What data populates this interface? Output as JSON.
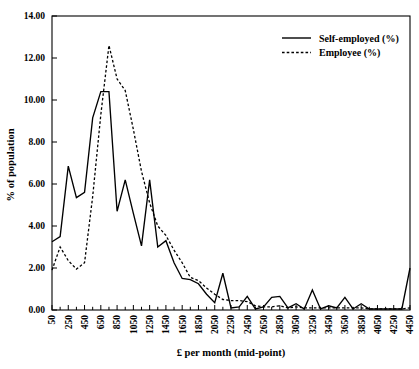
{
  "chart_data": {
    "type": "line",
    "title": "",
    "xlabel": "£ per month (mid-point)",
    "ylabel": "% of population",
    "xlim": [
      50,
      4450
    ],
    "ylim": [
      0.0,
      14.0
    ],
    "yticks": [
      "0.00",
      "2.00",
      "4.00",
      "6.00",
      "8.00",
      "10.00",
      "12.00",
      "14.00"
    ],
    "ytick_values": [
      0,
      2,
      4,
      6,
      8,
      10,
      12,
      14
    ],
    "grid": false,
    "legend_position": "top-right",
    "categories": [
      "50",
      "150",
      "250",
      "350",
      "450",
      "550",
      "650",
      "750",
      "850",
      "950",
      "1050",
      "1150",
      "1250",
      "1350",
      "1450",
      "1550",
      "1650",
      "1750",
      "1850",
      "1950",
      "2050",
      "2150",
      "2250",
      "2350",
      "2450",
      "2550",
      "2650",
      "2750",
      "2850",
      "2950",
      "3050",
      "3150",
      "3250",
      "3350",
      "3450",
      "3550",
      "3650",
      "3750",
      "3850",
      "3950",
      "4050",
      "4150",
      "4250",
      "4350",
      "4450"
    ],
    "xtick_labels": [
      "50",
      "250",
      "450",
      "650",
      "850",
      "1050",
      "1250",
      "1450",
      "1650",
      "1850",
      "2050",
      "2250",
      "2450",
      "2650",
      "2850",
      "3050",
      "3250",
      "3450",
      "3650",
      "3850",
      "4050",
      "4250",
      "4450"
    ],
    "series": [
      {
        "name": "Self-employed (%)",
        "style": "solid",
        "color": "#000000",
        "values": [
          3.25,
          3.5,
          6.85,
          5.35,
          5.6,
          9.15,
          10.4,
          10.4,
          4.7,
          6.2,
          4.6,
          3.05,
          6.2,
          3.0,
          3.3,
          2.25,
          1.5,
          1.45,
          1.25,
          0.75,
          0.35,
          1.75,
          0.1,
          0.15,
          0.65,
          0.05,
          0.15,
          0.6,
          0.65,
          0.1,
          0.3,
          0.05,
          0.95,
          0.05,
          0.2,
          0.1,
          0.6,
          0.05,
          0.3,
          0.05,
          0.05,
          0.05,
          0.05,
          0.05,
          2.0
        ]
      },
      {
        "name": "Employee (%)",
        "style": "dashed",
        "color": "#000000",
        "values": [
          1.9,
          3.0,
          2.35,
          1.95,
          2.25,
          5.4,
          9.3,
          12.6,
          11.0,
          10.45,
          8.6,
          6.6,
          5.1,
          4.0,
          3.55,
          2.85,
          2.25,
          1.55,
          1.4,
          1.05,
          0.75,
          0.5,
          0.45,
          0.45,
          0.4,
          0.2,
          0.15,
          0.15,
          0.2,
          0.1,
          0.15,
          0.1,
          0.1,
          0.1,
          0.1,
          0.1,
          0.1,
          0.1,
          0.1,
          0.05,
          0.05,
          0.05,
          0.05,
          0.05,
          0.1
        ]
      }
    ]
  },
  "legend": {
    "entries": [
      {
        "label": "Self-employed (%)",
        "style": "solid"
      },
      {
        "label": "Employee (%)",
        "style": "dashed"
      }
    ]
  }
}
